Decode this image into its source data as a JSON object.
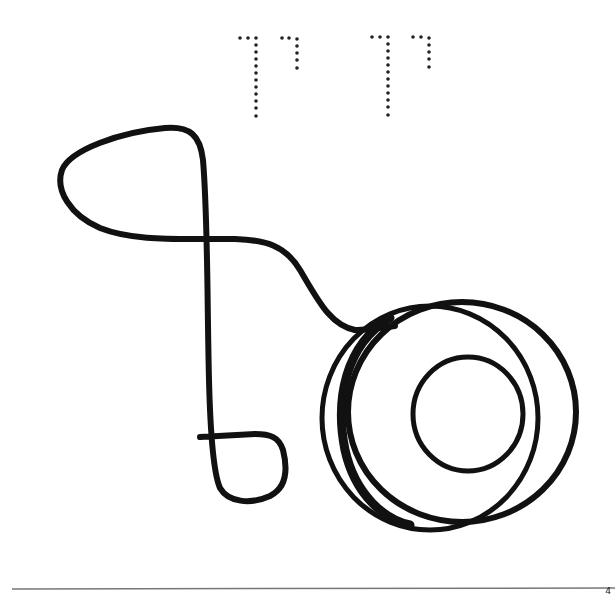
{
  "worksheet": {
    "subject": "yo-yo",
    "tracing_letters": {
      "description": "dotted Hebrew letters for tracing",
      "groups": [
        {
          "letters": [
            "ך",
            "י"
          ]
        },
        {
          "letters": [
            "ך",
            "י"
          ]
        }
      ]
    },
    "illustration": {
      "object": "yo-yo with looped string",
      "stroke_color": "#111111",
      "background_color": "#ffffff"
    },
    "page_number": "4"
  }
}
